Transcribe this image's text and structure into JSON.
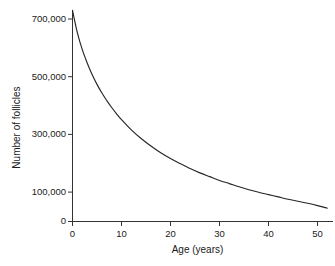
{
  "chart_data": {
    "type": "line",
    "title": "",
    "xlabel": "Age (years)",
    "ylabel": "Number of follicles",
    "xlim": [
      0,
      52
    ],
    "ylim": [
      0,
      730000
    ],
    "grid": false,
    "legend": null,
    "xticks": [
      0,
      10,
      20,
      30,
      40,
      50
    ],
    "xtick_labels": [
      "0",
      "10",
      "20",
      "30",
      "40",
      "50"
    ],
    "yticks": [
      0,
      100000,
      300000,
      500000,
      700000
    ],
    "ytick_labels": [
      "0",
      "100,000",
      "300,000",
      "500,000",
      "700,000"
    ],
    "line_color": "#262626",
    "series": [
      {
        "name": "Ovarian follicle reserve",
        "x": [
          0,
          1,
          2,
          3,
          4,
          5,
          6,
          7,
          8,
          9,
          10,
          12,
          14,
          16,
          18,
          20,
          22,
          24,
          26,
          28,
          30,
          32,
          34,
          36,
          38,
          40,
          42,
          44,
          46,
          48,
          50,
          52
        ],
        "y": [
          730000,
          652000,
          594000,
          548000,
          508000,
          474000,
          444000,
          418000,
          394000,
          372000,
          352000,
          317000,
          287000,
          261000,
          238000,
          218000,
          200000,
          183000,
          168000,
          155000,
          142000,
          131000,
          120000,
          110000,
          101000,
          93000,
          85000,
          77000,
          70000,
          63000,
          55000,
          46000
        ]
      }
    ]
  },
  "axes": {
    "y_ticks": [
      {
        "label": "700,000",
        "value": 700000
      },
      {
        "label": "500,000",
        "value": 500000
      },
      {
        "label": "300,000",
        "value": 300000
      },
      {
        "label": "100,000",
        "value": 100000
      },
      {
        "label": "0",
        "value": 0
      }
    ],
    "x_ticks": [
      {
        "label": "0",
        "value": 0
      },
      {
        "label": "10",
        "value": 10
      },
      {
        "label": "20",
        "value": 20
      },
      {
        "label": "30",
        "value": 30
      },
      {
        "label": "40",
        "value": 40
      },
      {
        "label": "50",
        "value": 50
      }
    ]
  }
}
